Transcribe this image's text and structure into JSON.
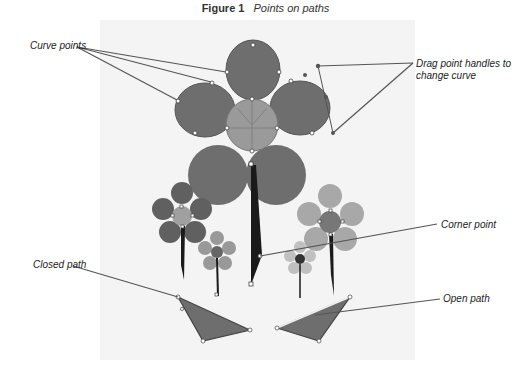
{
  "figure": {
    "number": "Figure 1",
    "caption": "Points on paths"
  },
  "callouts": {
    "curve_points": "Curve points",
    "drag_handles_line1": "Drag point handles to",
    "drag_handles_line2": "change curve",
    "corner_point": "Corner point",
    "closed_path": "Closed path",
    "open_path": "Open path"
  },
  "colors": {
    "panel": "#f4f4f4",
    "petal_dark": "#6e6e6e",
    "center_light": "#9a9a9a",
    "petal_light": "#a8a8a8",
    "stem": "#1a1a1a",
    "leader_line": "#555555",
    "anchor_point": "#ffffff"
  }
}
